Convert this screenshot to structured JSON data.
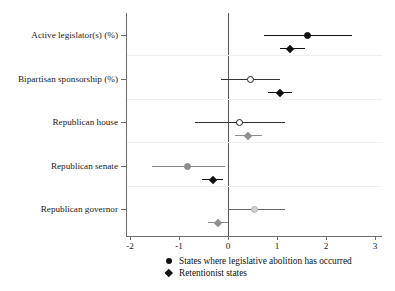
{
  "chart_data": {
    "type": "scatter",
    "subtype": "coefficient-plot-with-confidence-intervals",
    "title": "",
    "xlabel": "",
    "ylabel": "",
    "xlim": [
      -2.3,
      3.15
    ],
    "ylim": [
      0,
      5
    ],
    "grid": "faint horizontal gridlines between category bands",
    "x_ticks": [
      -2,
      -1,
      0,
      1,
      2,
      3
    ],
    "x_tick_labels": [
      "-2",
      "-1",
      "0",
      "1",
      "2",
      "3"
    ],
    "reference_line": 0,
    "categories": [
      "Active legislator(s) (%)",
      "Bipartisan sponsorship (%)",
      "Republican house",
      "Republican senate",
      "Republican governor"
    ],
    "series": [
      {
        "name": "States where legislative abolition has occurred",
        "marker": "circle",
        "points": [
          {
            "category": "Active legislator(s) (%)",
            "estimate": 1.62,
            "ci_low": 0.73,
            "ci_high": 2.53,
            "fill": "#111111",
            "filled": true
          },
          {
            "category": "Bipartisan sponsorship (%)",
            "estimate": 0.45,
            "ci_low": -0.14,
            "ci_high": 1.06,
            "fill": "#ffffff",
            "filled": false
          },
          {
            "category": "Republican house",
            "estimate": 0.24,
            "ci_low": -0.67,
            "ci_high": 1.16,
            "fill": "#ffffff",
            "filled": false
          },
          {
            "category": "Republican senate",
            "estimate": -0.82,
            "ci_low": -1.55,
            "ci_high": -0.06,
            "fill": "#8a8a8a",
            "filled": true
          },
          {
            "category": "Republican governor",
            "estimate": 0.55,
            "ci_low": 0.0,
            "ci_high": 1.16,
            "fill": "#cfcfcf",
            "filled": true
          }
        ]
      },
      {
        "name": "Retentionist states",
        "marker": "diamond",
        "points": [
          {
            "category": "Active legislator(s) (%)",
            "estimate": 1.27,
            "ci_low": 1.06,
            "ci_high": 1.57,
            "fill": "#111111"
          },
          {
            "category": "Bipartisan sponsorship (%)",
            "estimate": 1.06,
            "ci_low": 0.82,
            "ci_high": 1.31,
            "fill": "#111111"
          },
          {
            "category": "Republican house",
            "estimate": 0.41,
            "ci_low": 0.14,
            "ci_high": 0.69,
            "fill": "#8d8d8d"
          },
          {
            "category": "Republican senate",
            "estimate": -0.31,
            "ci_low": -0.53,
            "ci_high": -0.1,
            "fill": "#111111"
          },
          {
            "category": "Republican governor",
            "estimate": -0.2,
            "ci_low": -0.41,
            "ci_high": 0.0,
            "fill": "#8d8d8d"
          }
        ]
      }
    ],
    "legend": {
      "position": "bottom-center",
      "entries": [
        {
          "label": "States where legislative abolition has occurred",
          "marker": "circle"
        },
        {
          "label": "Retentionist states",
          "marker": "diamond"
        }
      ]
    }
  },
  "axis": {
    "y_labels": [
      "Active legislator(s) (%)",
      "Bipartisan sponsorship (%)",
      "Republican house",
      "Republican senate",
      "Republican governor"
    ],
    "x_tick_labels": [
      "-2",
      "-1",
      "0",
      "1",
      "2",
      "3"
    ]
  },
  "legend": {
    "entry_1": "States where legislative abolition has occurred",
    "entry_2": "Retentionist states"
  },
  "colors": {
    "dark": "#111111",
    "mid_gray": "#8a8a8a",
    "light_gray": "#cfcfcf",
    "axis": "#6b6b6b",
    "grid": "#f0eeee",
    "background": "#ffffff"
  }
}
